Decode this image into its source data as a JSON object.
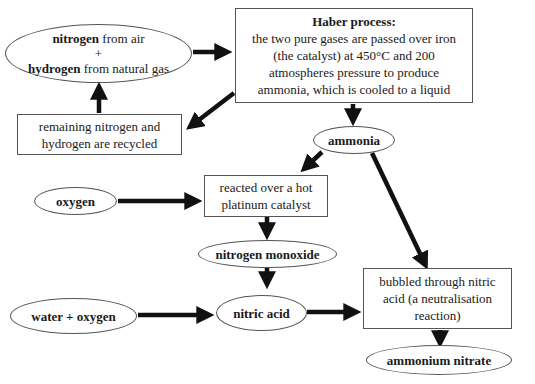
{
  "diagram": {
    "nodes": {
      "raw_materials": {
        "line1_bold": "nitrogen",
        "line1_rest": " from air",
        "plus": "+",
        "line3_bold": "hydrogen",
        "line3_rest": " from natural gas"
      },
      "haber": {
        "title": "Haber process:",
        "l1": "the two pure gases are passed over iron",
        "l2": "(the catalyst) at 450°C and 200",
        "l3": "atmospheres pressure to produce",
        "l4": "ammonia, which is cooled to a liquid"
      },
      "recycle": {
        "l1": "remaining nitrogen and",
        "l2": "hydrogen are recycled"
      },
      "ammonia": {
        "label": "ammonia"
      },
      "oxygen": {
        "label": "oxygen"
      },
      "platinum": {
        "l1": "reacted over a hot",
        "l2": "platinum catalyst"
      },
      "nitrogen_monoxide": {
        "label": "nitrogen monoxide"
      },
      "water_oxygen": {
        "label": "water + oxygen"
      },
      "nitric_acid": {
        "label": "nitric acid"
      },
      "neutralisation": {
        "l1": "bubbled through nitric",
        "l2": "acid (a neutralisation",
        "l3": "reaction)"
      },
      "ammonium_nitrate": {
        "label": "ammonium nitrate"
      }
    },
    "edges": [
      [
        "raw_materials",
        "haber"
      ],
      [
        "haber",
        "recycle"
      ],
      [
        "recycle",
        "raw_materials"
      ],
      [
        "haber",
        "ammonia"
      ],
      [
        "ammonia",
        "platinum"
      ],
      [
        "ammonia",
        "neutralisation"
      ],
      [
        "oxygen",
        "platinum"
      ],
      [
        "platinum",
        "nitrogen_monoxide"
      ],
      [
        "nitrogen_monoxide",
        "nitric_acid"
      ],
      [
        "water_oxygen",
        "nitric_acid"
      ],
      [
        "nitric_acid",
        "neutralisation"
      ],
      [
        "neutralisation",
        "ammonium_nitrate"
      ]
    ]
  }
}
